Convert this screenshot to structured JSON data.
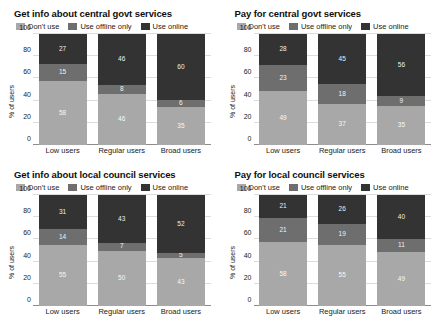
{
  "colors": {
    "dont_use": "#a8a8a8",
    "use_offline_only": "#6e6e6e",
    "use_online": "#333333",
    "grid": "#dcdcdc",
    "axis": "#8c8c8c",
    "background": "#ffffff",
    "text": "#1a1a1a",
    "label_text": "#ffffff"
  },
  "legend": {
    "items": [
      {
        "label": "Don't use",
        "key": "dont_use"
      },
      {
        "label": "Use offline only",
        "key": "use_offline_only"
      },
      {
        "label": "Use online",
        "key": "use_online"
      }
    ]
  },
  "axis": {
    "ylabel": "% of users",
    "yticks": [
      "0",
      "20",
      "40",
      "60",
      "80",
      "100"
    ],
    "ylim": [
      0,
      100
    ],
    "categories": [
      "Low users",
      "Regular users",
      "Broad users"
    ]
  },
  "chart_data": [
    {
      "type": "bar",
      "title": "Get info about central govt services",
      "subtype": "stacked-100",
      "xlabel": "",
      "ylabel": "% of users",
      "ylim": [
        0,
        100
      ],
      "grid": true,
      "legend_position": "top",
      "categories": [
        "Low users",
        "Regular users",
        "Broad users"
      ],
      "series": [
        {
          "name": "Don't use",
          "values": [
            58,
            46,
            35
          ]
        },
        {
          "name": "Use offline only",
          "values": [
            15,
            8,
            6
          ]
        },
        {
          "name": "Use online",
          "values": [
            27,
            46,
            60
          ]
        }
      ]
    },
    {
      "type": "bar",
      "title": "Pay for central govt services",
      "subtype": "stacked-100",
      "xlabel": "",
      "ylabel": "% of users",
      "ylim": [
        0,
        100
      ],
      "grid": true,
      "legend_position": "top",
      "categories": [
        "Low users",
        "Regular users",
        "Broad users"
      ],
      "series": [
        {
          "name": "Don't use",
          "values": [
            49,
            37,
            35
          ]
        },
        {
          "name": "Use offline only",
          "values": [
            23,
            18,
            9
          ]
        },
        {
          "name": "Use online",
          "values": [
            28,
            45,
            56
          ]
        }
      ]
    },
    {
      "type": "bar",
      "title": "Get info about local council services",
      "subtype": "stacked-100",
      "xlabel": "",
      "ylabel": "% of users",
      "ylim": [
        0,
        100
      ],
      "grid": true,
      "legend_position": "top",
      "categories": [
        "Low users",
        "Regular users",
        "Broad users"
      ],
      "series": [
        {
          "name": "Don't use",
          "values": [
            55,
            50,
            43
          ]
        },
        {
          "name": "Use offline only",
          "values": [
            14,
            7,
            5
          ]
        },
        {
          "name": "Use online",
          "values": [
            31,
            43,
            52
          ]
        }
      ]
    },
    {
      "type": "bar",
      "title": "Pay for local council services",
      "subtype": "stacked-100",
      "xlabel": "",
      "ylabel": "% of users",
      "ylim": [
        0,
        100
      ],
      "grid": true,
      "legend_position": "top",
      "categories": [
        "Low users",
        "Regular users",
        "Broad users"
      ],
      "series": [
        {
          "name": "Don't use",
          "values": [
            58,
            55,
            49
          ]
        },
        {
          "name": "Use offline only",
          "values": [
            21,
            19,
            11
          ]
        },
        {
          "name": "Use online",
          "values": [
            21,
            26,
            40
          ]
        }
      ]
    }
  ]
}
